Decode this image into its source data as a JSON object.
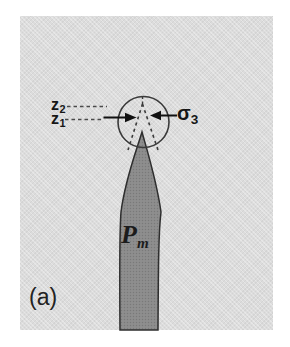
{
  "figure": {
    "panel_label": "(a)",
    "labels": {
      "z2": {
        "base": "z",
        "sub": "2"
      },
      "z1": {
        "base": "z",
        "sub": "1"
      },
      "sigma3": {
        "base": "σ",
        "sub": "3"
      },
      "pm": {
        "base": "P",
        "sub": "m"
      }
    },
    "icons": {
      "left_arrow": "arrow-right-icon",
      "right_arrow": "arrow-left-icon"
    },
    "colors": {
      "page_bg": "#ffffff",
      "panel_bg": "#dcdcdc",
      "dike_fill": "#8e8e8e",
      "dike_dot": "#797979",
      "outline": "#2e2e2e",
      "line": "#3a3a3a",
      "text": "#161616"
    }
  }
}
